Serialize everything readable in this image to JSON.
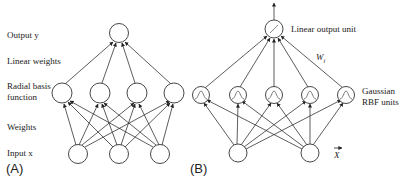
{
  "panel_a": {
    "tag": "(A)",
    "labels": {
      "output": "Output y",
      "linear_weights": "Linear weights",
      "rbf_line1": "Radial basis",
      "rbf_line2": "function",
      "weights": "Weights",
      "input": "Input x"
    },
    "layers": {
      "input_nodes": 3,
      "hidden_nodes": 4,
      "output_nodes": 1
    }
  },
  "panel_b": {
    "tag": "(B)",
    "labels": {
      "output_unit": "Linear output unit",
      "weight": "W",
      "weight_subscript": "i",
      "rbf_line1": "Gaussian",
      "rbf_line2": "RBF units",
      "input_vector": "X"
    },
    "layers": {
      "input_nodes": 2,
      "hidden_nodes": 5,
      "output_nodes": 1
    }
  },
  "colors": {
    "stroke": "#333333",
    "text": "#222222",
    "background": "#ffffff"
  }
}
